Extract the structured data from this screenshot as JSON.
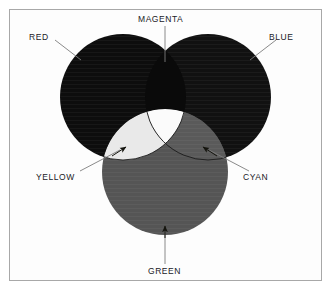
{
  "figure": {
    "background": "#ffffff",
    "border_color": "#a8a8a8"
  },
  "labels": {
    "magenta": "MAGENTA",
    "red": "RED",
    "blue": "BLUE",
    "yellow": "YELLOW",
    "cyan": "CYAN",
    "green": "GREEN"
  },
  "icons": {
    "yellow_arrow": "arrow-up-right-icon",
    "cyan_arrow": "arrow-up-left-icon",
    "green_arrow": "arrow-up-icon"
  },
  "chart_data": {
    "type": "diagram",
    "subtype": "venn-3-circle",
    "grid": false,
    "legend": "none",
    "circles": [
      {
        "name": "RED",
        "cx": 123,
        "cy": 97,
        "r": 63,
        "fill": "#0d0d0d"
      },
      {
        "name": "BLUE",
        "cx": 208,
        "cy": 97,
        "r": 63,
        "fill": "#111111"
      },
      {
        "name": "GREEN",
        "cx": 165,
        "cy": 172,
        "r": 63,
        "fill": "#555555"
      }
    ],
    "overlaps": [
      {
        "name": "MAGENTA",
        "of": [
          "RED",
          "BLUE"
        ],
        "fill": "#0a0a0a"
      },
      {
        "name": "YELLOW",
        "of": [
          "RED",
          "GREEN"
        ],
        "fill": "#ededed"
      },
      {
        "name": "CYAN",
        "of": [
          "BLUE",
          "GREEN"
        ],
        "fill": "#5a5a5a"
      },
      {
        "name": "WHITE",
        "of": [
          "RED",
          "BLUE",
          "GREEN"
        ],
        "fill": "#fbfbfb"
      }
    ],
    "leaders": [
      {
        "label": "MAGENTA",
        "from": [
          165,
          26
        ],
        "to": [
          165,
          62
        ],
        "arrow": false
      },
      {
        "label": "RED",
        "from": [
          55,
          40
        ],
        "to": [
          80,
          59
        ],
        "arrow": false
      },
      {
        "label": "BLUE",
        "from": [
          276,
          40
        ],
        "to": [
          251,
          59
        ],
        "arrow": false
      },
      {
        "label": "YELLOW",
        "from": [
          80,
          170
        ],
        "to": [
          122,
          148
        ],
        "arrow": true
      },
      {
        "label": "CYAN",
        "from": [
          248,
          170
        ],
        "to": [
          206,
          148
        ],
        "arrow": true
      },
      {
        "label": "GREEN",
        "from": [
          165,
          265
        ],
        "to": [
          165,
          228
        ],
        "arrow": true
      }
    ],
    "colors": {
      "paper": "#ffffff",
      "ink": "#20201f",
      "leader": "#7d7d7d",
      "dark": "#0d0d0d",
      "mid": "#555555",
      "light": "#ededed",
      "white": "#fbfbfb"
    }
  }
}
